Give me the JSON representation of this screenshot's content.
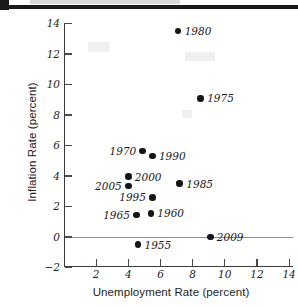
{
  "chart_data": {
    "type": "scatter",
    "title": "",
    "xlabel": "Unemployment Rate (percent)",
    "ylabel": "Inflation Rate (percent)",
    "xlim": [
      0,
      14.6
    ],
    "ylim": [
      -2,
      14
    ],
    "xticks": [
      2,
      4,
      6,
      8,
      10,
      12,
      14
    ],
    "yticks": [
      -2,
      0,
      2,
      4,
      6,
      8,
      10,
      12,
      14
    ],
    "grid": false,
    "legend": "none",
    "zero_reference_line": 0,
    "point_color": "#151515",
    "axis_color": "#3b3b3b",
    "zero_line_color": "#8d8d8d",
    "points": [
      {
        "label": "1980",
        "x": 7.1,
        "y": 13.5,
        "label_side": "right"
      },
      {
        "label": "1975",
        "x": 8.5,
        "y": 9.1,
        "label_side": "right"
      },
      {
        "label": "1970",
        "x": 4.9,
        "y": 5.65,
        "label_side": "left"
      },
      {
        "label": "1990",
        "x": 5.5,
        "y": 5.3,
        "label_side": "right"
      },
      {
        "label": "2000",
        "x": 4.0,
        "y": 3.95,
        "label_side": "right"
      },
      {
        "label": "2005",
        "x": 4.0,
        "y": 3.35,
        "label_side": "left"
      },
      {
        "label": "1985",
        "x": 7.2,
        "y": 3.5,
        "label_side": "right"
      },
      {
        "label": "1995",
        "x": 5.5,
        "y": 2.6,
        "label_side": "left"
      },
      {
        "label": "1965",
        "x": 4.5,
        "y": 1.45,
        "label_side": "left"
      },
      {
        "label": "1960",
        "x": 5.4,
        "y": 1.55,
        "label_side": "right"
      },
      {
        "label": "2009",
        "x": 9.1,
        "y": 0.0,
        "label_side": "right"
      },
      {
        "label": "1955",
        "x": 4.6,
        "y": -0.5,
        "label_side": "right"
      }
    ]
  }
}
